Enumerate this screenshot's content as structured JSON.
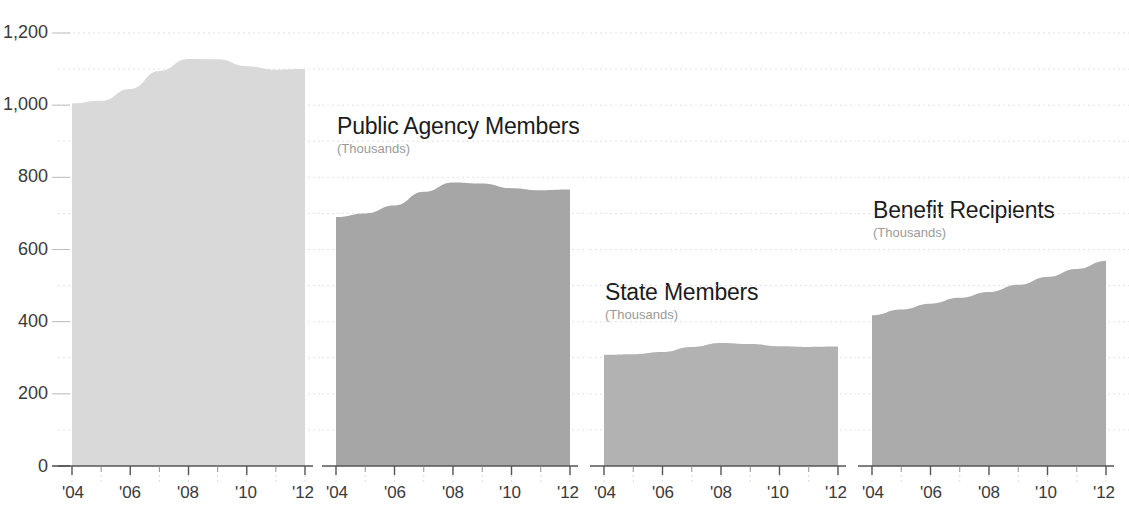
{
  "chart_data": [
    {
      "type": "area",
      "title": "",
      "subtitle": "(Thousands)",
      "xlabel": "",
      "ylabel": "",
      "x": [
        2004,
        2005,
        2006,
        2007,
        2008,
        2009,
        2010,
        2011,
        2012
      ],
      "tick_labels": [
        "'04",
        "'06",
        "'08",
        "'10",
        "'12"
      ],
      "values": [
        1005,
        1012,
        1045,
        1095,
        1128,
        1127,
        1108,
        1098,
        1100
      ],
      "ylim": [
        0,
        1200
      ],
      "grid": true,
      "legend": "none",
      "color": "#d9d9d9"
    },
    {
      "type": "area",
      "title": "Public Agency Members",
      "subtitle": "(Thousands)",
      "xlabel": "",
      "ylabel": "",
      "x": [
        2004,
        2005,
        2006,
        2007,
        2008,
        2009,
        2010,
        2011,
        2012
      ],
      "tick_labels": [
        "'04",
        "'06",
        "'08",
        "'10",
        "'12"
      ],
      "values": [
        690,
        700,
        722,
        760,
        786,
        783,
        770,
        764,
        766
      ],
      "ylim": [
        0,
        1200
      ],
      "grid": true,
      "legend": "none",
      "color": "#a6a6a6"
    },
    {
      "type": "area",
      "title": "State Members",
      "subtitle": "(Thousands)",
      "xlabel": "",
      "ylabel": "",
      "x": [
        2004,
        2005,
        2006,
        2007,
        2008,
        2009,
        2010,
        2011,
        2012
      ],
      "tick_labels": [
        "'04",
        "'06",
        "'08",
        "'10",
        "'12"
      ],
      "values": [
        308,
        310,
        316,
        330,
        341,
        338,
        332,
        330,
        331
      ],
      "ylim": [
        0,
        1200
      ],
      "grid": true,
      "legend": "none",
      "color": "#b2b2b2"
    },
    {
      "type": "area",
      "title": "Benefit Recipients",
      "subtitle": "(Thousands)",
      "xlabel": "",
      "ylabel": "",
      "x": [
        2004,
        2005,
        2006,
        2007,
        2008,
        2009,
        2010,
        2011,
        2012
      ],
      "tick_labels": [
        "'04",
        "'06",
        "'08",
        "'10",
        "'12"
      ],
      "values": [
        418,
        434,
        450,
        466,
        482,
        502,
        524,
        546,
        568
      ],
      "ylim": [
        0,
        1200
      ],
      "grid": true,
      "legend": "none",
      "color": "#ababab"
    }
  ],
  "yaxis": {
    "ticks": [
      "0",
      "200",
      "400",
      "600",
      "800",
      "1,000",
      "1,200"
    ],
    "values": [
      0,
      200,
      400,
      600,
      800,
      1000,
      1200
    ],
    "minor_step": 100
  },
  "xaxis": {
    "ticks": [
      "'04",
      "'06",
      "'08",
      "'10",
      "'12"
    ],
    "years": [
      2004,
      2006,
      2008,
      2010,
      2012
    ]
  },
  "panels": [
    {
      "title": "",
      "subtitle": "(Thousands)"
    },
    {
      "title": "Public Agency Members",
      "subtitle": "(Thousands)"
    },
    {
      "title": "State Members",
      "subtitle": "(Thousands)"
    },
    {
      "title": "Benefit Recipients",
      "subtitle": "(Thousands)"
    }
  ],
  "colors": {
    "series1": "#d9d9d9",
    "series2": "#a6a6a6",
    "series3": "#b2b2b2",
    "series4": "#ababab",
    "gridline": "#e2e2e2",
    "axis": "#6f6f6f",
    "label": "#3a3a3a",
    "subtitle": "#9a9a9a",
    "title": "#1c1c1c"
  }
}
